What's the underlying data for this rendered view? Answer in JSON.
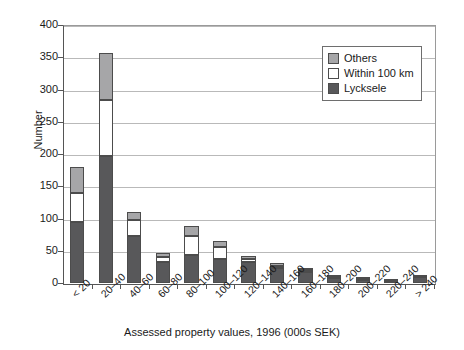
{
  "chart_data": {
    "type": "bar",
    "subtype": "stacked",
    "title": "",
    "xlabel": "Assessed property values, 1996 (000s SEK)",
    "ylabel": "Number",
    "ylim": [
      0,
      400
    ],
    "ytick_step": 50,
    "yticks": [
      "400",
      "350",
      "300",
      "250",
      "200",
      "150",
      "100",
      "50",
      "0"
    ],
    "grid": "horizontal",
    "legend_position": "top-right-inside",
    "categories": [
      "< 20",
      "20–40",
      "40–60",
      "60–80",
      "80–100",
      "100–120",
      "120–140",
      "140–160",
      "160–180",
      "180–200",
      "200–220",
      "220–240",
      "> 240"
    ],
    "series": [
      {
        "name": "Lycksele",
        "color": "#58585a",
        "values": [
          95,
          197,
          73,
          32,
          43,
          38,
          33,
          23,
          17,
          8,
          5,
          3,
          9
        ]
      },
      {
        "name": "Within 100 km",
        "color": "#ffffff",
        "values": [
          45,
          87,
          25,
          8,
          30,
          18,
          5,
          4,
          3,
          2,
          1,
          1,
          1
        ]
      },
      {
        "name": "Others",
        "color": "#a6a6a8",
        "values": [
          40,
          72,
          12,
          7,
          15,
          9,
          4,
          4,
          4,
          3,
          1,
          0,
          0
        ]
      }
    ],
    "totals": [
      180,
      356,
      110,
      47,
      88,
      65,
      42,
      31,
      24,
      13,
      7,
      4,
      10
    ]
  },
  "legend": {
    "items": [
      {
        "label": "Others",
        "color": "#a6a6a8"
      },
      {
        "label": "Within 100 km",
        "color": "#ffffff"
      },
      {
        "label": "Lycksele",
        "color": "#58585a"
      }
    ]
  },
  "axes": {
    "y_title": "Number",
    "x_title": "Assessed property values, 1996 (000s SEK)"
  }
}
